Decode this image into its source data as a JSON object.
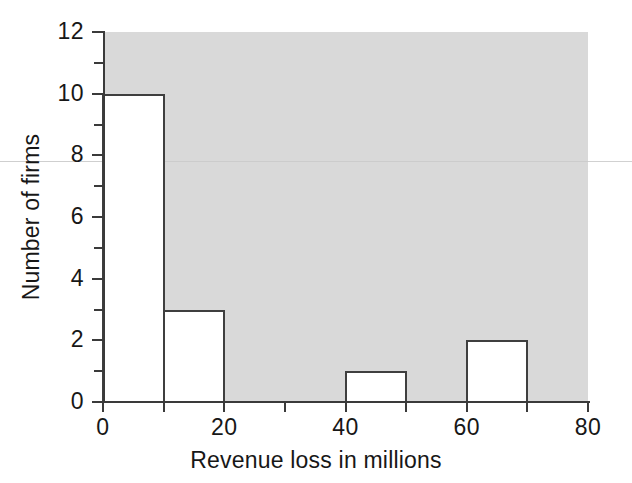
{
  "chart_data": {
    "type": "bar",
    "title": "",
    "subtitle": "",
    "xlabel": "Revenue loss in millions",
    "ylabel": "Number of firms",
    "categories": [
      "0-10",
      "10-20",
      "20-30",
      "30-40",
      "40-50",
      "50-60",
      "60-70",
      "70-80"
    ],
    "bin_edges": [
      0,
      10,
      20,
      30,
      40,
      50,
      60,
      70,
      80
    ],
    "values": [
      10,
      3,
      0,
      0,
      1,
      0,
      2,
      0
    ],
    "bars": [
      {
        "label": "0-10",
        "x_start": 0,
        "x_end": 10,
        "value": 10
      },
      {
        "label": "10-20",
        "x_start": 10,
        "x_end": 20,
        "value": 3
      },
      {
        "label": "40-50",
        "x_start": 40,
        "x_end": 50,
        "value": 1
      },
      {
        "label": "60-70",
        "x_start": 60,
        "x_end": 70,
        "value": 2
      }
    ],
    "xlim": [
      0,
      80
    ],
    "ylim": [
      0,
      12
    ],
    "x_ticks": [
      0,
      10,
      20,
      30,
      40,
      50,
      60,
      70,
      80
    ],
    "x_tick_labels": [
      "0",
      "",
      "20",
      "",
      "40",
      "",
      "60",
      "",
      "80"
    ],
    "y_ticks": [
      0,
      1,
      2,
      3,
      4,
      5,
      6,
      7,
      8,
      9,
      10,
      11,
      12
    ],
    "y_tick_labels": [
      "0",
      "",
      "2",
      "",
      "4",
      "",
      "6",
      "",
      "8",
      "",
      "10",
      "",
      "12"
    ],
    "grid": false,
    "legend": null,
    "colors": {
      "plot_background": "#d9d9d9",
      "page_background": "#ffffff",
      "bar_fill": "#ffffff",
      "bar_stroke": "#3f3f3f",
      "axis": "#3a3a3a",
      "text": "#171717"
    }
  }
}
